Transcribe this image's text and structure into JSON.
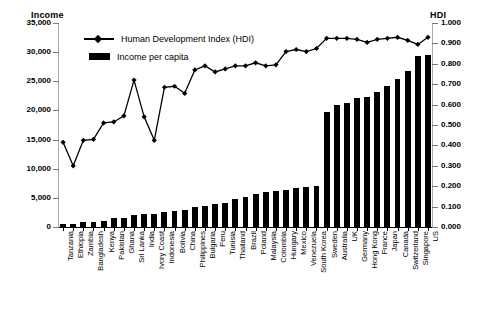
{
  "chart_data": {
    "type": "bar",
    "title": "",
    "subtitle": "",
    "xlabel": "",
    "ylabel": "Income",
    "y2label": "HDI",
    "grid": false,
    "legend_position": "top-left",
    "ylim": [
      0,
      35000
    ],
    "y2lim": [
      0,
      1.0
    ],
    "ytick_labels": [
      "35,000",
      "30,000",
      "25,000",
      "20,000",
      "15,000",
      "10,000",
      "5,000",
      "0"
    ],
    "ytick_values": [
      35000,
      30000,
      25000,
      20000,
      15000,
      10000,
      5000,
      0
    ],
    "y2tick_labels": [
      "1.000",
      "0.900",
      "0.800",
      "0.700",
      "0.600",
      "0.500",
      "0.400",
      "0.300",
      "0.200",
      "0.100",
      "0.000"
    ],
    "y2tick_values": [
      1.0,
      0.9,
      0.8,
      0.7,
      0.6,
      0.5,
      0.4,
      0.3,
      0.2,
      0.1,
      0.0
    ],
    "categories": [
      "Tanzania",
      "Ethiopia",
      "Zambia",
      "Bangladesh",
      "Kenya",
      "Pakistan",
      "Ghana",
      "Sri Lanka",
      "India",
      "Ivory Coast",
      "Indonesia",
      "Bolivia",
      "China",
      "Philippines",
      "Bulgaria",
      "Peru",
      "Tunisia",
      "Thailand",
      "Brazil",
      "Poland",
      "Malaysia",
      "Colombia",
      "Hungary",
      "Mexico",
      "Venezuela",
      "South Korea",
      "Sweden",
      "Australia",
      "UK",
      "Germany",
      "Hong Kong",
      "France",
      "Japan",
      "Canada",
      "Switzerland",
      "Singapore",
      "US"
    ],
    "series": [
      {
        "name": "Income per capita",
        "type": "bar",
        "axis": "left",
        "unit": "",
        "values": [
          500,
          450,
          800,
          900,
          1000,
          1500,
          1600,
          2100,
          2200,
          2300,
          2500,
          2700,
          3000,
          3400,
          3600,
          4000,
          4200,
          4800,
          5200,
          5600,
          6000,
          6200,
          6400,
          6700,
          6900,
          7000,
          19800,
          21000,
          21200,
          22200,
          22300,
          23200,
          24200,
          25400,
          26800,
          29400,
          29500
        ]
      },
      {
        "name": "Human Development Index (HDI)",
        "type": "line",
        "axis": "right",
        "unit": "",
        "values": [
          0.415,
          0.3,
          0.425,
          0.43,
          0.51,
          0.515,
          0.545,
          0.72,
          0.54,
          0.425,
          0.685,
          0.69,
          0.655,
          0.77,
          0.79,
          0.76,
          0.775,
          0.79,
          0.79,
          0.805,
          0.79,
          0.795,
          0.86,
          0.87,
          0.86,
          0.875,
          0.925,
          0.925,
          0.925,
          0.92,
          0.905,
          0.92,
          0.925,
          0.93,
          0.915,
          0.895,
          0.93
        ]
      }
    ],
    "legend": [
      {
        "label": "Human Development Index (HDI)",
        "marker": "line-diamond",
        "color": "#000000"
      },
      {
        "label": "Income per capita",
        "marker": "bar",
        "color": "#000000"
      }
    ]
  }
}
